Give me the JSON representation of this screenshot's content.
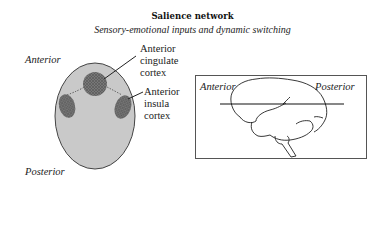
{
  "title": "Salience network",
  "subtitle": "Sensory-emotional inputs and dynamic switching",
  "left_panel": {
    "anterior_label": "Anterior",
    "posterior_label": "Posterior",
    "regions": [
      {
        "name": "Anterior cingulate cortex",
        "lines": [
          "Anterior",
          "cingulate",
          "cortex"
        ]
      },
      {
        "name": "Anterior insula cortex",
        "lines": [
          "Anterior",
          "insula",
          "cortex"
        ]
      }
    ]
  },
  "right_panel": {
    "anterior_label": "Anterior",
    "posterior_label": "Posterior"
  },
  "colors": {
    "oval_fill": "#c8c8c8",
    "region_fill": "#6e6e6e",
    "outline": "#3a3a3a"
  }
}
